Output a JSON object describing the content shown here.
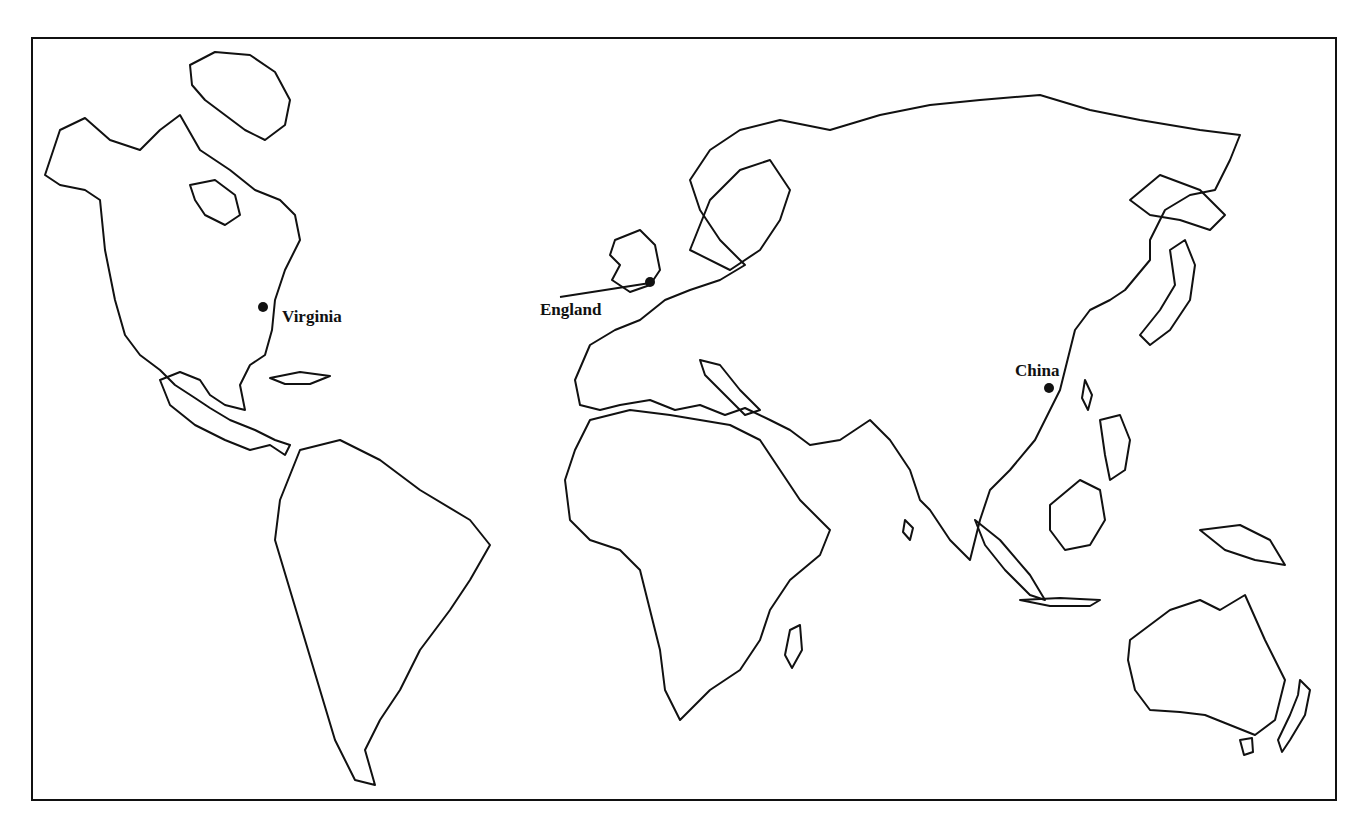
{
  "map": {
    "type": "outline world map",
    "projection": "Pacific-split, Americas at left, Asia/Australia at right",
    "colors": {
      "background": "#ffffff",
      "outline": "#111111",
      "marker": "#111111"
    },
    "locations": [
      {
        "name": "Virginia",
        "marker": "dot",
        "label_side": "right"
      },
      {
        "name": "England",
        "marker": "dot",
        "label_side": "left",
        "leader_line": true
      },
      {
        "name": "China",
        "marker": "dot",
        "label_side": "above"
      }
    ]
  }
}
